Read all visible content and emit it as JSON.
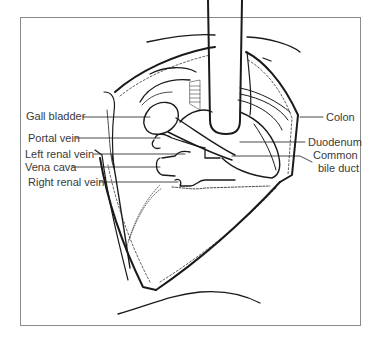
{
  "figure": {
    "type": "anatomical line drawing"
  },
  "labels": {
    "left": [
      {
        "id": "gall-bladder",
        "text": "Gall bladder"
      },
      {
        "id": "portal-vein",
        "text": "Portal vein"
      },
      {
        "id": "left-renal-vein",
        "text": "Left renal vein"
      },
      {
        "id": "vena-cava",
        "text": "Vena cava"
      },
      {
        "id": "right-renal-vein",
        "text": "Right renal vein"
      }
    ],
    "right": [
      {
        "id": "colon",
        "text": "Colon"
      },
      {
        "id": "duodenum",
        "text": "Duodenum"
      },
      {
        "id": "common-bile-duct-line1",
        "text": "Common"
      },
      {
        "id": "common-bile-duct-line2",
        "text": "bile duct"
      }
    ]
  },
  "colors": {
    "line": "#1a1a1a",
    "label_text": "#3a3a3a",
    "frame": "#8a8a8a",
    "background": "#ffffff"
  }
}
